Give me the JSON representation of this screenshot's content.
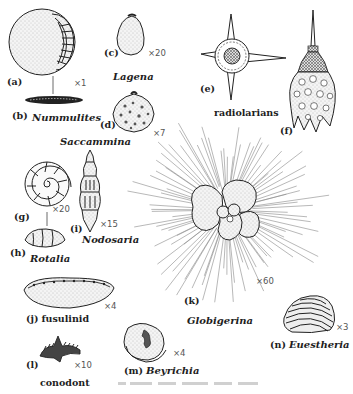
{
  "figure": {
    "group_label": "radiolarians",
    "caption": "",
    "specimens": [
      {
        "id": "a",
        "letter": "(a)",
        "name": "",
        "magnification": "×1"
      },
      {
        "id": "b",
        "letter": "(b)",
        "name": "Nummulites",
        "magnification": ""
      },
      {
        "id": "c",
        "letter": "(c)",
        "name": "Lagena",
        "magnification": "×20"
      },
      {
        "id": "d",
        "letter": "(d)",
        "name": "Saccammina",
        "magnification": "×7"
      },
      {
        "id": "e",
        "letter": "(e)",
        "name": "",
        "magnification": ""
      },
      {
        "id": "f",
        "letter": "(f)",
        "name": "",
        "magnification": ""
      },
      {
        "id": "g",
        "letter": "(g)",
        "name": "",
        "magnification": "×20"
      },
      {
        "id": "h",
        "letter": "(h)",
        "name": "Rotalia",
        "magnification": ""
      },
      {
        "id": "i",
        "letter": "(i)",
        "name": "Nodosaria",
        "magnification": "×15"
      },
      {
        "id": "j",
        "letter": "(j)",
        "name": "fusulinid",
        "magnification": "×4"
      },
      {
        "id": "k",
        "letter": "(k)",
        "name": "Globigerina",
        "magnification": "×60"
      },
      {
        "id": "l",
        "letter": "(l)",
        "name": "conodont",
        "magnification": "×10"
      },
      {
        "id": "m",
        "letter": "(m)",
        "name": "Beyrichia",
        "magnification": "×4"
      },
      {
        "id": "n",
        "letter": "(n)",
        "name": "Euestheria",
        "magnification": "×3"
      }
    ]
  }
}
